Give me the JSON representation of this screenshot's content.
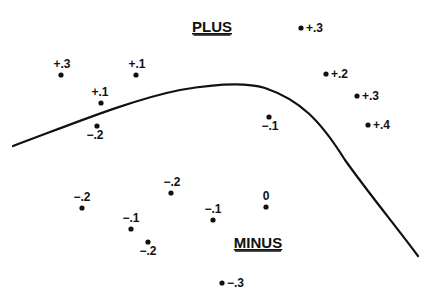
{
  "diagram": {
    "regions": {
      "plus": {
        "label": "PLUS",
        "x": 212,
        "y": 32
      },
      "minus": {
        "label": "MINUS",
        "x": 258,
        "y": 248
      }
    },
    "boundary_curve": {
      "description": "decision boundary curve separating PLUS and MINUS regions",
      "path": "M13,146 C70,125 130,100 180,90 C215,84 245,82 265,88 C300,100 320,120 345,160 C370,195 395,225 418,256",
      "color": "#111111"
    },
    "points": [
      {
        "label": "+.3",
        "dot": [
          61,
          75
        ],
        "text": [
          62,
          68
        ],
        "anchor": "middle"
      },
      {
        "label": "+.1",
        "dot": [
          136,
          75
        ],
        "text": [
          137,
          68
        ],
        "anchor": "middle"
      },
      {
        "label": "+.1",
        "dot": [
          101,
          103
        ],
        "text": [
          100,
          96
        ],
        "anchor": "middle"
      },
      {
        "label": "−.2",
        "dot": [
          97,
          126
        ],
        "text": [
          95,
          139
        ],
        "anchor": "middle"
      },
      {
        "label": "+.3",
        "dot": [
          301,
          28
        ],
        "text": [
          306,
          32
        ],
        "anchor": "start"
      },
      {
        "label": "+.2",
        "dot": [
          326,
          74
        ],
        "text": [
          331,
          78
        ],
        "anchor": "start"
      },
      {
        "label": "+.3",
        "dot": [
          357,
          96
        ],
        "text": [
          362,
          100
        ],
        "anchor": "start"
      },
      {
        "label": "+.4",
        "dot": [
          368,
          125
        ],
        "text": [
          373,
          129
        ],
        "anchor": "start"
      },
      {
        "label": "−.1",
        "dot": [
          269,
          117
        ],
        "text": [
          270,
          130
        ],
        "anchor": "middle"
      },
      {
        "label": "−.2",
        "dot": [
          82,
          208
        ],
        "text": [
          82,
          201
        ],
        "anchor": "middle"
      },
      {
        "label": "−.2",
        "dot": [
          171,
          193
        ],
        "text": [
          172,
          186
        ],
        "anchor": "middle"
      },
      {
        "label": "−.1",
        "dot": [
          131,
          229
        ],
        "text": [
          131,
          222
        ],
        "anchor": "middle"
      },
      {
        "label": "−.2",
        "dot": [
          148,
          242
        ],
        "text": [
          148,
          255
        ],
        "anchor": "middle"
      },
      {
        "label": "−.1",
        "dot": [
          213,
          220
        ],
        "text": [
          213,
          213
        ],
        "anchor": "middle"
      },
      {
        "label": "0",
        "dot": [
          266,
          207
        ],
        "text": [
          266,
          200
        ],
        "anchor": "middle"
      },
      {
        "label": "−.3",
        "dot": [
          222,
          283
        ],
        "text": [
          227,
          287
        ],
        "anchor": "start"
      }
    ]
  }
}
